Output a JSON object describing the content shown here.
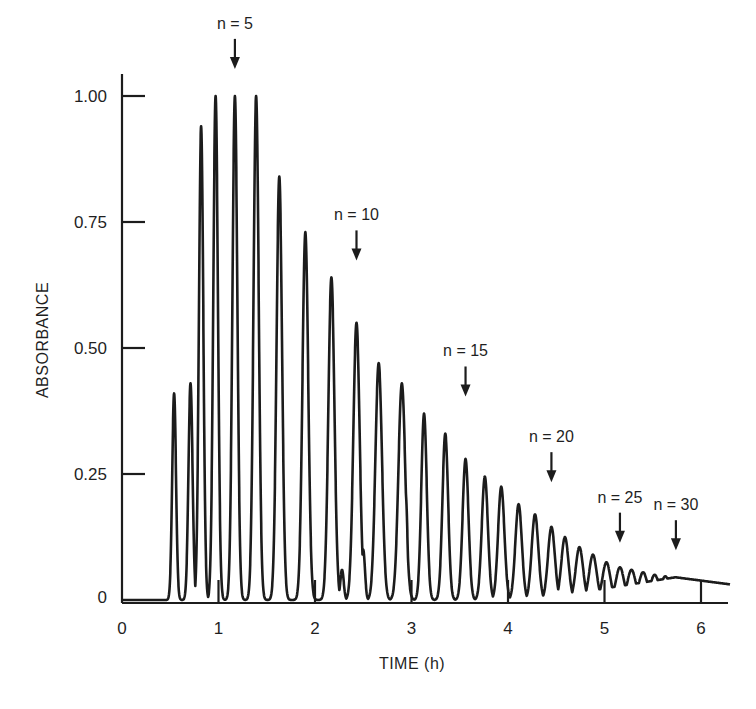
{
  "chart_data": {
    "type": "line",
    "title": "",
    "xlabel": "TIME (h)",
    "ylabel": "ABSORBANCE",
    "xlim": [
      0,
      6.3
    ],
    "ylim": [
      0,
      1.05
    ],
    "grid": false,
    "legend": null,
    "x_ticks": [
      0,
      1,
      2,
      3,
      4,
      5,
      6
    ],
    "x_tick_labels": [
      "0",
      "1",
      "2",
      "3",
      "4",
      "5",
      "6"
    ],
    "y_ticks": [
      0,
      0.25,
      0.5,
      0.75,
      1.0
    ],
    "y_tick_labels": [
      "0",
      "0.25",
      "0.50",
      "0.75",
      "1.00"
    ],
    "series": [
      {
        "name": "absorbance trace (cycles)",
        "peaks": [
          {
            "n": 1,
            "x": 0.54,
            "y": 0.41
          },
          {
            "n": 2,
            "x": 0.71,
            "y": 0.43
          },
          {
            "n": 3,
            "x": 0.82,
            "y": 0.94
          },
          {
            "n": 4,
            "x": 0.97,
            "y": 1.0
          },
          {
            "n": 5,
            "x": 1.17,
            "y": 1.0
          },
          {
            "n": 6,
            "x": 1.39,
            "y": 1.0
          },
          {
            "n": 7,
            "x": 1.63,
            "y": 0.84
          },
          {
            "n": 8,
            "x": 1.9,
            "y": 0.73
          },
          {
            "n": 9,
            "x": 2.17,
            "y": 0.64
          },
          {
            "n": 10,
            "x": 2.43,
            "y": 0.55
          },
          {
            "n": 11,
            "x": 2.66,
            "y": 0.47
          },
          {
            "n": 12,
            "x": 2.9,
            "y": 0.43
          },
          {
            "n": 13,
            "x": 3.13,
            "y": 0.37
          },
          {
            "n": 14,
            "x": 3.35,
            "y": 0.33
          },
          {
            "n": 15,
            "x": 3.56,
            "y": 0.28
          },
          {
            "n": 16,
            "x": 3.76,
            "y": 0.245
          },
          {
            "n": 17,
            "x": 3.93,
            "y": 0.225
          },
          {
            "n": 18,
            "x": 4.11,
            "y": 0.19
          },
          {
            "n": 19,
            "x": 4.28,
            "y": 0.17
          },
          {
            "n": 20,
            "x": 4.45,
            "y": 0.145
          },
          {
            "n": 21,
            "x": 4.59,
            "y": 0.125
          },
          {
            "n": 22,
            "x": 4.74,
            "y": 0.105
          },
          {
            "n": 23,
            "x": 4.88,
            "y": 0.09
          },
          {
            "n": 24,
            "x": 5.02,
            "y": 0.075
          },
          {
            "n": 25,
            "x": 5.16,
            "y": 0.065
          },
          {
            "n": 26,
            "x": 5.28,
            "y": 0.06
          },
          {
            "n": 27,
            "x": 5.4,
            "y": 0.055
          },
          {
            "n": 28,
            "x": 5.52,
            "y": 0.05
          },
          {
            "n": 29,
            "x": 5.63,
            "y": 0.047
          },
          {
            "n": 30,
            "x": 5.74,
            "y": 0.044
          }
        ],
        "minor_features": [
          {
            "x": 2.28,
            "y": 0.06,
            "type": "secondary bump"
          },
          {
            "x": 2.5,
            "y": 0.1,
            "type": "secondary bump"
          },
          {
            "x": 2.94,
            "y": 0.21,
            "type": "shoulder"
          }
        ],
        "tail": [
          {
            "x": 5.9,
            "y": 0.04
          },
          {
            "x": 6.3,
            "y": 0.03
          }
        ]
      }
    ],
    "annotations": [
      {
        "text": "n = 5",
        "x": 1.17,
        "arrow_to_y": 1.03
      },
      {
        "text": "n = 10",
        "x": 2.43,
        "arrow_to_y": 0.65
      },
      {
        "text": "n = 15",
        "x": 3.56,
        "arrow_to_y": 0.38
      },
      {
        "text": "n = 20",
        "x": 4.45,
        "arrow_to_y": 0.21
      },
      {
        "text": "n = 25",
        "x": 5.16,
        "arrow_to_y": 0.09
      },
      {
        "text": "n = 30",
        "x": 5.74,
        "arrow_to_y": 0.075
      }
    ]
  }
}
